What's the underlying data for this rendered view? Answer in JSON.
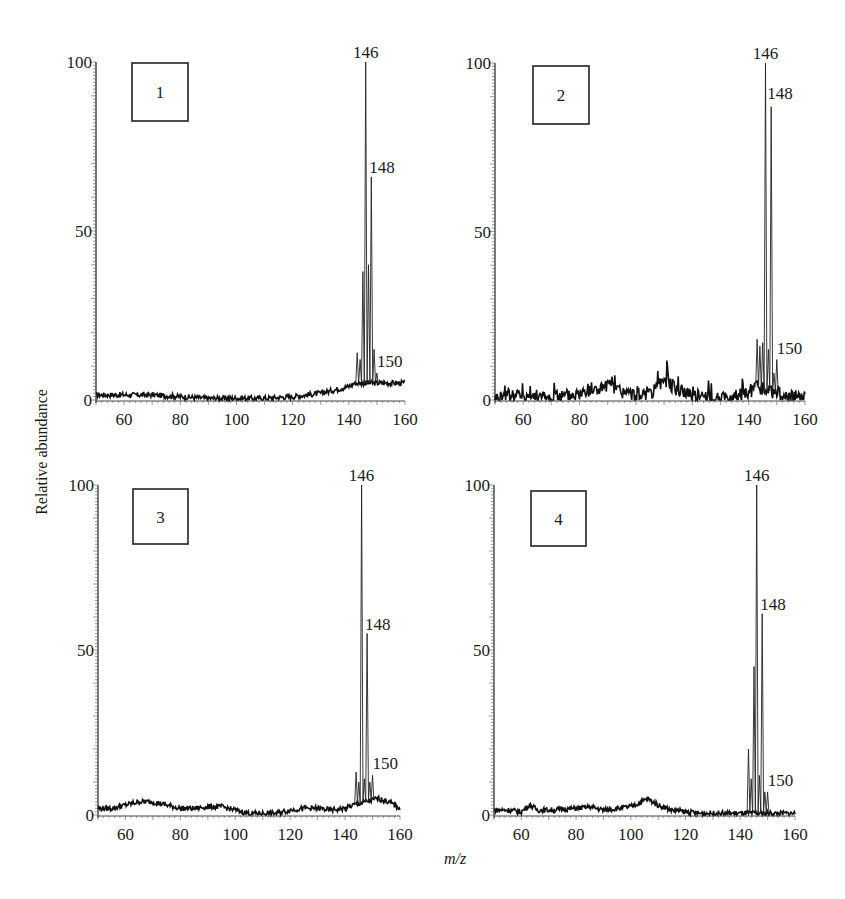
{
  "figure": {
    "ylabel": "Relative abundance",
    "xlabel": "m/z"
  },
  "chart_data": [
    {
      "type": "line",
      "panel": "1",
      "title": "1",
      "xlabel": "m/z",
      "ylabel": "Relative abundance",
      "xlim": [
        50,
        160
      ],
      "ylim": [
        0,
        100
      ],
      "xticks": [
        60,
        80,
        100,
        120,
        140,
        160
      ],
      "yticks": [
        0,
        50,
        100
      ],
      "grid": false,
      "peak_labels": [
        {
          "mz": 146,
          "label": "146",
          "abundance": 100
        },
        {
          "mz": 148,
          "label": "148",
          "abundance": 66
        },
        {
          "mz": 150,
          "label": "150",
          "abundance": 8
        }
      ],
      "peaks": [
        {
          "mz": 143,
          "abundance": 14
        },
        {
          "mz": 144,
          "abundance": 12
        },
        {
          "mz": 145,
          "abundance": 38
        },
        {
          "mz": 146,
          "abundance": 100
        },
        {
          "mz": 147,
          "abundance": 40
        },
        {
          "mz": 148,
          "abundance": 66
        },
        {
          "mz": 149,
          "abundance": 15
        },
        {
          "mz": 150,
          "abundance": 8
        }
      ],
      "baseline": [
        [
          50,
          1.5
        ],
        [
          60,
          1.5
        ],
        [
          70,
          1.5
        ],
        [
          80,
          1
        ],
        [
          90,
          0.5
        ],
        [
          100,
          0.5
        ],
        [
          110,
          0.5
        ],
        [
          120,
          1
        ],
        [
          130,
          2
        ],
        [
          135,
          3
        ],
        [
          140,
          4
        ],
        [
          142,
          5
        ],
        [
          152,
          5
        ],
        [
          156,
          5
        ],
        [
          160,
          5
        ]
      ]
    },
    {
      "type": "line",
      "panel": "2",
      "title": "2",
      "xlabel": "m/z",
      "ylabel": "Relative abundance",
      "xlim": [
        50,
        160
      ],
      "ylim": [
        0,
        100
      ],
      "xticks": [
        60,
        80,
        100,
        120,
        140,
        160
      ],
      "yticks": [
        0,
        50,
        100
      ],
      "grid": false,
      "peak_labels": [
        {
          "mz": 146,
          "label": "146",
          "abundance": 100
        },
        {
          "mz": 148,
          "label": "148",
          "abundance": 87
        },
        {
          "mz": 150,
          "label": "150",
          "abundance": 12
        }
      ],
      "peaks": [
        {
          "mz": 143,
          "abundance": 18
        },
        {
          "mz": 144,
          "abundance": 16
        },
        {
          "mz": 145,
          "abundance": 17
        },
        {
          "mz": 146,
          "abundance": 100
        },
        {
          "mz": 147,
          "abundance": 15
        },
        {
          "mz": 148,
          "abundance": 87
        },
        {
          "mz": 149,
          "abundance": 8
        },
        {
          "mz": 150,
          "abundance": 12
        }
      ],
      "baseline": [
        [
          50,
          0.5
        ],
        [
          55,
          1.5
        ],
        [
          60,
          1.5
        ],
        [
          70,
          0.5
        ],
        [
          80,
          2
        ],
        [
          85,
          3
        ],
        [
          90,
          4
        ],
        [
          95,
          2.5
        ],
        [
          100,
          1
        ],
        [
          105,
          1
        ],
        [
          108,
          4
        ],
        [
          110,
          6
        ],
        [
          115,
          3
        ],
        [
          120,
          2
        ],
        [
          125,
          0.5
        ],
        [
          130,
          0
        ],
        [
          135,
          1
        ],
        [
          140,
          2
        ],
        [
          142,
          4
        ],
        [
          151,
          2
        ],
        [
          152,
          0.5
        ],
        [
          160,
          1
        ]
      ]
    },
    {
      "type": "line",
      "panel": "3",
      "title": "3",
      "xlabel": "m/z",
      "ylabel": "Relative abundance",
      "xlim": [
        50,
        160
      ],
      "ylim": [
        0,
        100
      ],
      "xticks": [
        60,
        80,
        100,
        120,
        140,
        160
      ],
      "yticks": [
        0,
        50,
        100
      ],
      "grid": false,
      "peak_labels": [
        {
          "mz": 146,
          "label": "146",
          "abundance": 100
        },
        {
          "mz": 148,
          "label": "148",
          "abundance": 55
        },
        {
          "mz": 150,
          "label": "150",
          "abundance": 12
        }
      ],
      "peaks": [
        {
          "mz": 144,
          "abundance": 13
        },
        {
          "mz": 145,
          "abundance": 10
        },
        {
          "mz": 146,
          "abundance": 100
        },
        {
          "mz": 147,
          "abundance": 11
        },
        {
          "mz": 148,
          "abundance": 55
        },
        {
          "mz": 149,
          "abundance": 10
        },
        {
          "mz": 150,
          "abundance": 12
        }
      ],
      "baseline": [
        [
          50,
          2
        ],
        [
          55,
          2
        ],
        [
          60,
          3
        ],
        [
          65,
          4
        ],
        [
          70,
          4
        ],
        [
          75,
          3
        ],
        [
          80,
          2
        ],
        [
          85,
          2
        ],
        [
          90,
          2.5
        ],
        [
          95,
          2.5
        ],
        [
          100,
          1.5
        ],
        [
          105,
          0.5
        ],
        [
          110,
          0.5
        ],
        [
          115,
          0.5
        ],
        [
          120,
          1.5
        ],
        [
          125,
          2
        ],
        [
          130,
          2
        ],
        [
          135,
          1.5
        ],
        [
          140,
          2
        ],
        [
          143,
          3
        ],
        [
          152,
          5
        ],
        [
          156,
          4
        ],
        [
          160,
          2
        ]
      ]
    },
    {
      "type": "line",
      "panel": "4",
      "title": "4",
      "xlabel": "m/z",
      "ylabel": "Relative abundance",
      "xlim": [
        50,
        160
      ],
      "ylim": [
        0,
        100
      ],
      "xticks": [
        60,
        80,
        100,
        120,
        140,
        160
      ],
      "yticks": [
        0,
        50,
        100
      ],
      "grid": false,
      "peak_labels": [
        {
          "mz": 146,
          "label": "146",
          "abundance": 100
        },
        {
          "mz": 148,
          "label": "148",
          "abundance": 61
        },
        {
          "mz": 150,
          "label": "150",
          "abundance": 7
        }
      ],
      "peaks": [
        {
          "mz": 143,
          "abundance": 20
        },
        {
          "mz": 144,
          "abundance": 11
        },
        {
          "mz": 145,
          "abundance": 45
        },
        {
          "mz": 146,
          "abundance": 100
        },
        {
          "mz": 147,
          "abundance": 12
        },
        {
          "mz": 148,
          "abundance": 61
        },
        {
          "mz": 149,
          "abundance": 7
        },
        {
          "mz": 150,
          "abundance": 7
        }
      ],
      "baseline": [
        [
          50,
          1.5
        ],
        [
          55,
          1.5
        ],
        [
          60,
          1
        ],
        [
          63,
          3
        ],
        [
          66,
          1.5
        ],
        [
          70,
          1.5
        ],
        [
          80,
          2
        ],
        [
          85,
          2.5
        ],
        [
          90,
          1.5
        ],
        [
          95,
          2
        ],
        [
          100,
          2.5
        ],
        [
          104,
          4
        ],
        [
          106,
          5
        ],
        [
          110,
          3
        ],
        [
          115,
          1.5
        ],
        [
          120,
          1
        ],
        [
          125,
          0.5
        ],
        [
          130,
          0.5
        ],
        [
          135,
          0.5
        ],
        [
          140,
          0.5
        ],
        [
          142,
          0.5
        ],
        [
          151,
          0.5
        ],
        [
          160,
          0.5
        ]
      ]
    }
  ]
}
